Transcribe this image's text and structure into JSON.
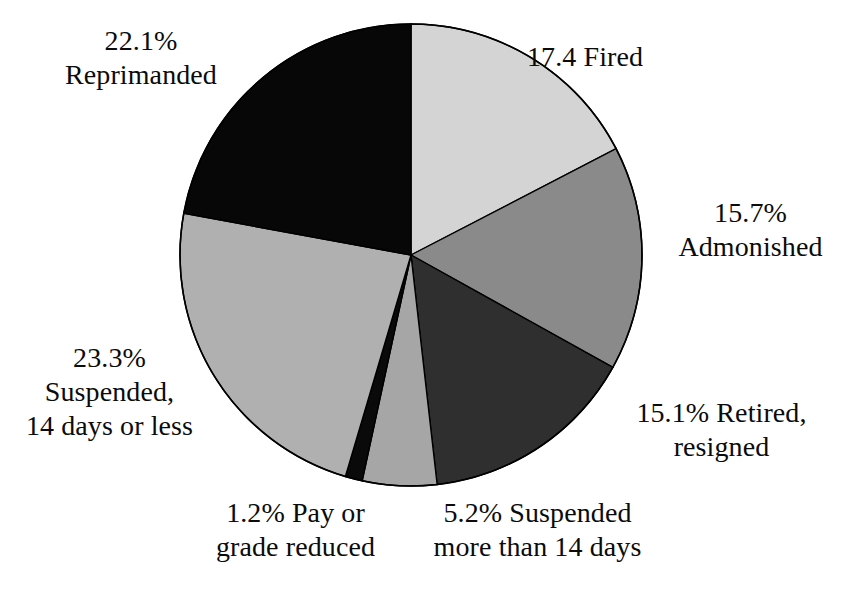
{
  "chart_data": {
    "type": "pie",
    "title": "",
    "subtitle": "",
    "units": "percent",
    "total": 100.0,
    "start_angle_deg": 0,
    "direction": "clockwise",
    "legend": "none",
    "labels_position": "outside",
    "categories": [
      "Fired",
      "Admonished",
      "Retired, resigned",
      "Suspended more than 14 days",
      "Pay or grade reduced",
      "Suspended, 14 days or less",
      "Reprimanded"
    ],
    "values": [
      17.4,
      15.7,
      15.1,
      5.2,
      1.2,
      23.3,
      22.1
    ],
    "slices": [
      {
        "name": "fired",
        "value": 17.4,
        "label_text": "17.4 Fired",
        "value_text": "17.4",
        "category_text": "Fired",
        "color": "#d4d4d4",
        "start_deg": 0.0,
        "end_deg": 62.6
      },
      {
        "name": "admonished",
        "value": 15.7,
        "label_text": "15.7%\nAdmonished",
        "value_text": "15.7%",
        "category_text": "Admonished",
        "color": "#8a8a8a",
        "start_deg": 62.6,
        "end_deg": 119.1
      },
      {
        "name": "retired-resigned",
        "value": 15.1,
        "label_text": "15.1% Retired,\nresigned",
        "value_text": "15.1%",
        "category_text": "Retired, resigned",
        "color": "#2f2f2f",
        "start_deg": 119.1,
        "end_deg": 173.5
      },
      {
        "name": "suspended-more-than-14-days",
        "value": 5.2,
        "label_text": "5.2% Suspended\nmore than 14 days",
        "value_text": "5.2%",
        "category_text": "Suspended more than 14 days",
        "color": "#a6a6a6",
        "start_deg": 173.5,
        "end_deg": 192.2
      },
      {
        "name": "pay-or-grade-reduced",
        "value": 1.2,
        "label_text": "1.2% Pay or\ngrade reduced",
        "value_text": "1.2%",
        "category_text": "Pay or grade reduced",
        "color": "#0a0a0a",
        "start_deg": 192.2,
        "end_deg": 196.5
      },
      {
        "name": "suspended-14-days-or-less",
        "value": 23.3,
        "label_text": "23.3%\nSuspended,\n14 days or less",
        "value_text": "23.3%",
        "category_text": "Suspended, 14 days or less",
        "color": "#b0b0b0",
        "start_deg": 196.5,
        "end_deg": 280.4
      },
      {
        "name": "reprimanded",
        "value": 22.1,
        "label_text": "22.1%\nReprimanded",
        "value_text": "22.1%",
        "category_text": "Reprimanded",
        "color": "#070707",
        "start_deg": 280.4,
        "end_deg": 360.0
      }
    ],
    "geometry": {
      "center_x": 411,
      "center_y": 255,
      "radius": 231,
      "outline_color": "#000000",
      "outline_width": 1.6,
      "background": "#ffffff"
    }
  },
  "labels": {
    "reprimanded": "22.1%\nReprimanded",
    "fired": "17.4 Fired",
    "admonished": "15.7%\nAdmonished",
    "retired": "15.1% Retired,\nresigned",
    "suspended_more": "5.2% Suspended\nmore than 14 days",
    "pay_reduced": "1.2% Pay or\ngrade reduced",
    "suspended_less": "23.3%\nSuspended,\n14 days or less"
  }
}
